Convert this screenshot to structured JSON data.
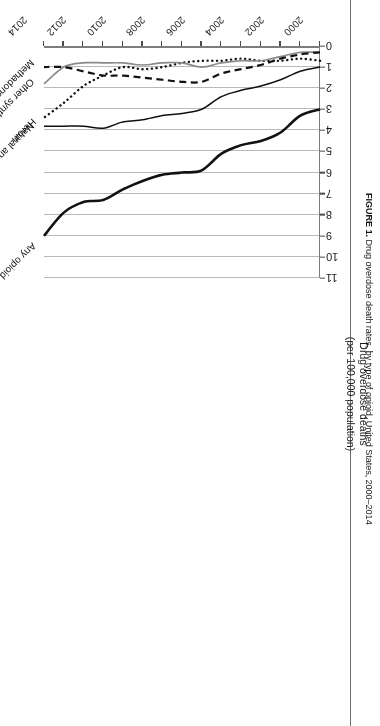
{
  "figure": {
    "caption_label": "FIGURE 1.",
    "caption_text": "Drug overdose death rates, by type of opioid, United States, 2000–2014"
  },
  "chart_data": {
    "type": "line",
    "title": "Drug overdose death rates, by type of opioid, United States, 2000–2014",
    "xlabel": "",
    "ylabel": "Drug overdose deaths (per 100,000 population)",
    "ylabel_line1": "Drug overdose deaths",
    "ylabel_line2": "(per 100,000 population)",
    "xlim": [
      2000,
      2014
    ],
    "ylim": [
      0,
      11
    ],
    "yticks": [
      0,
      1,
      2,
      3,
      4,
      5,
      6,
      7,
      8,
      9,
      10,
      11
    ],
    "xticks": [
      2000,
      2001,
      2002,
      2003,
      2004,
      2005,
      2006,
      2007,
      2008,
      2009,
      2010,
      2011,
      2012,
      2013,
      2014
    ],
    "xtick_labels_shown": [
      "2000",
      "2002",
      "2004",
      "2006",
      "2008",
      "2010",
      "2012",
      "2014"
    ],
    "grid": "horizontal",
    "legend_position": "inline-end-labels",
    "x": [
      2000,
      2001,
      2002,
      2003,
      2004,
      2005,
      2006,
      2007,
      2008,
      2009,
      2010,
      2011,
      2012,
      2013,
      2014
    ],
    "series": [
      {
        "name": "Any opioid",
        "style": "solid-thick",
        "color": "#111111",
        "values": [
          3.0,
          3.3,
          4.1,
          4.5,
          4.7,
          5.1,
          5.9,
          6.0,
          6.1,
          6.4,
          6.8,
          7.3,
          7.4,
          7.9,
          9.0
        ]
      },
      {
        "name": "Natural and semisynthetic opioids (e.g., oxycodone, hydrocodone)",
        "style": "solid",
        "color": "#111111",
        "values": [
          1.0,
          1.2,
          1.6,
          1.9,
          2.1,
          2.4,
          3.0,
          3.2,
          3.3,
          3.5,
          3.6,
          3.9,
          3.8,
          3.8,
          3.8
        ]
      },
      {
        "name": "Heroin",
        "style": "dotted",
        "color": "#111111",
        "values": [
          0.7,
          0.6,
          0.7,
          0.7,
          0.6,
          0.7,
          0.7,
          0.8,
          1.0,
          1.1,
          1.0,
          1.4,
          1.9,
          2.7,
          3.4
        ]
      },
      {
        "name": "Other synthetic opioids (e.g., fentanyl, tramadol)",
        "style": "solid-gray",
        "color": "#8a8a8a",
        "values": [
          0.3,
          0.3,
          0.5,
          0.7,
          0.7,
          0.8,
          1.0,
          0.8,
          0.8,
          0.9,
          0.8,
          0.8,
          0.8,
          1.0,
          1.8
        ]
      },
      {
        "name": "Methadone",
        "style": "dashed",
        "color": "#111111",
        "values": [
          0.3,
          0.4,
          0.6,
          0.9,
          1.1,
          1.3,
          1.7,
          1.7,
          1.6,
          1.5,
          1.4,
          1.4,
          1.2,
          1.0,
          1.0
        ]
      }
    ]
  }
}
